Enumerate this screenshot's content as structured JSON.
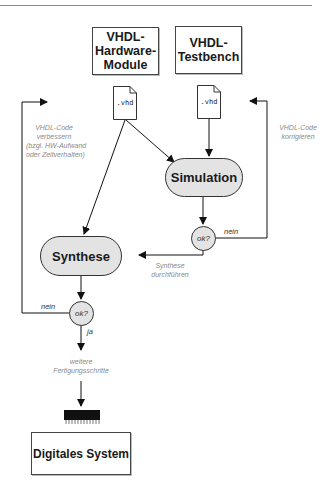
{
  "diagram": {
    "inputs": [
      {
        "id": "hw",
        "label_lines": [
          "VHDL-",
          "Hardware-",
          "Module"
        ]
      },
      {
        "id": "tb",
        "label_lines": [
          "VHDL-",
          "Testbench"
        ]
      }
    ],
    "files": [
      {
        "id": "hw_file",
        "label": ".vhd"
      },
      {
        "id": "tb_file",
        "label": ".vhd"
      }
    ],
    "processes": {
      "simulation": "Simulation",
      "synthese": "Synthese"
    },
    "decisions": {
      "sim_check": "ok?",
      "syn_check": "ok?"
    },
    "edge_labels": {
      "sim_nein": "nein",
      "syn_nein": "nein",
      "syn_ja": "ja"
    },
    "notes": {
      "left_feedback": [
        "VHDL-Code",
        "verbessern",
        "(bzgl. HW-Aufwand",
        "oder Zeitverhalten)"
      ],
      "right_feedback": [
        "VHDL-Code",
        "korrigieren"
      ],
      "synth_run": [
        "Synthese",
        "durchführen"
      ],
      "further_steps": [
        "weitere",
        "Fertigungsschritte"
      ]
    },
    "output": {
      "label": "Digitales System",
      "chip_icon": "ic-chip-icon"
    },
    "colors": {
      "process_fill": "#e3e3e3",
      "stroke": "#1a1a1a",
      "note_text": "#8a8a8a"
    }
  }
}
